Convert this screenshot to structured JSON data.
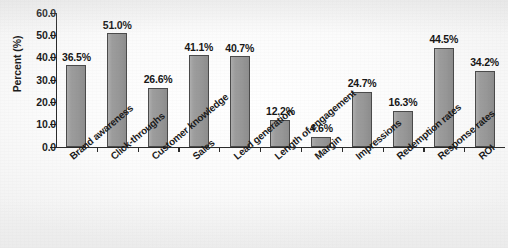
{
  "chart_data": {
    "type": "bar",
    "title": "",
    "xlabel": "",
    "ylabel": "Percent (%)",
    "ylim": [
      0,
      60
    ],
    "ytick_step": 10,
    "grid": false,
    "legend": "none",
    "value_label_suffix": "%",
    "categories": [
      "Brand awareness",
      "Click-throughs",
      "Customer knowledge",
      "Sales",
      "Lead generation",
      "Length of engagement",
      "Margin",
      "Impressions",
      "Redemption rates",
      "Response rates",
      "ROI"
    ],
    "values": [
      36.5,
      51.0,
      26.6,
      41.1,
      40.7,
      12.2,
      4.6,
      24.7,
      16.3,
      44.5,
      34.2
    ],
    "value_labels": [
      "36.5%",
      "51.0%",
      "26.6%",
      "41.1%",
      "40.7%",
      "12.2%",
      "4.6%",
      "24.7%",
      "16.3%",
      "44.5%",
      "34.2%"
    ],
    "ytick_labels": [
      "0.0",
      "10.0",
      "20.0",
      "30.0",
      "40.0",
      "50.0",
      "60.0"
    ],
    "colors": {
      "bar_fill": "#9a9a9a",
      "bar_border": "#4a4a4a",
      "axis": "#2b2b2b",
      "text": "#1a1a1a",
      "background": "#ffffff"
    }
  }
}
